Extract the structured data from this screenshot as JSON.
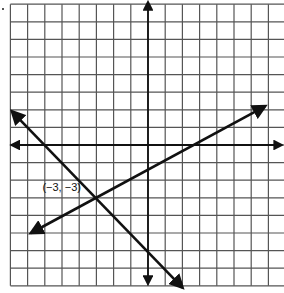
{
  "figure": {
    "type": "coordinate-plane",
    "grid": {
      "x_min": -8,
      "x_max": 8,
      "y_min": -8,
      "y_max": 8,
      "step": 1
    },
    "axes": {
      "x_axis_arrows": true,
      "y_axis_arrows": true
    },
    "colors": {
      "grid": "#555555",
      "axes": "#111111",
      "lines": "#111111",
      "background": "#ffffff"
    },
    "lines": [
      {
        "name": "line-decreasing",
        "from": [
          -7.9,
          1.9
        ],
        "to": [
          2,
          -8.1
        ]
      },
      {
        "name": "line-increasing",
        "from": [
          -6.8,
          -5
        ],
        "to": [
          6.8,
          2.2
        ]
      }
    ],
    "intersection": {
      "x": -3,
      "y": -3,
      "label": "(−3, −3)"
    }
  }
}
